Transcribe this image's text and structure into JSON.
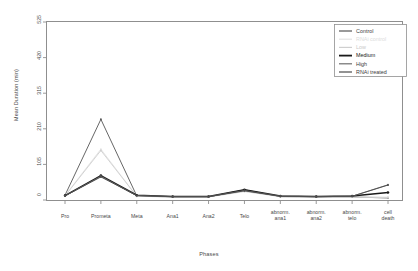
{
  "chart_data": {
    "type": "line",
    "title": "",
    "xlabel": "Phases",
    "ylabel": "Mean Duration (min)",
    "grid": false,
    "legend_position": "top-right",
    "ylim": [
      0,
      525
    ],
    "yticks": [
      0,
      105,
      210,
      315,
      420,
      525
    ],
    "ytick_labels": [
      "0",
      "105",
      "210",
      "315",
      "420",
      "525"
    ],
    "categories": [
      "Pro",
      "Prometa",
      "Meta",
      "Ana1",
      "Ana2",
      "Telo",
      "abnorm. ana1",
      "abnorm. ana2",
      "abnorm. telo",
      "cell death"
    ],
    "series": [
      {
        "name": "Control",
        "color": "#555555",
        "width": 0.9,
        "values": [
          14,
          238,
          12,
          9,
          9,
          30,
          10,
          9,
          9,
          6
        ]
      },
      {
        "name": "RNAi control",
        "color": "#e2e2e2",
        "width": 0.9,
        "values": [
          13,
          150,
          11,
          9,
          9,
          26,
          10,
          9,
          9,
          7
        ]
      },
      {
        "name": "Low",
        "color": "#cfcfcf",
        "width": 0.9,
        "values": [
          12,
          146,
          11,
          9,
          9,
          25,
          10,
          9,
          9,
          8
        ]
      },
      {
        "name": "Medium",
        "color": "#1a1a1a",
        "width": 1.5,
        "values": [
          13,
          72,
          14,
          10,
          10,
          30,
          12,
          10,
          12,
          22
        ]
      },
      {
        "name": "High",
        "color": "#6e6e6e",
        "width": 0.9,
        "values": [
          12,
          70,
          13,
          10,
          10,
          28,
          11,
          10,
          11,
          45
        ]
      },
      {
        "name": "RNAi treated",
        "color": "#4a4a4a",
        "width": 0.9,
        "values": [
          12,
          68,
          13,
          10,
          10,
          27,
          11,
          10,
          11,
          44
        ]
      }
    ]
  }
}
